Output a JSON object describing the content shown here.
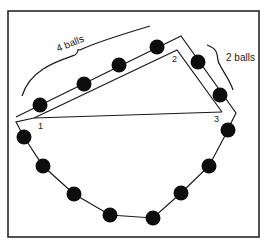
{
  "diagram": {
    "frame": {
      "x": 8,
      "y": 11,
      "width": 251,
      "height": 226
    },
    "colors": {
      "line": "#1a1a1a",
      "ball": "#0d0d0d",
      "background": "#ffffff"
    },
    "labels": {
      "four_balls": "4 balls",
      "two_balls": "2 balls",
      "vertex_1": "1",
      "vertex_2": "2",
      "vertex_3": "3"
    },
    "triangle": {
      "v1": [
        34,
        118
      ],
      "v2": [
        177,
        50
      ],
      "v3": [
        222,
        112
      ]
    },
    "balls": [
      [
        40,
        105
      ],
      [
        84,
        84
      ],
      [
        119,
        65
      ],
      [
        157,
        47
      ],
      [
        198,
        62
      ],
      [
        220,
        95
      ],
      [
        228,
        130
      ],
      [
        209,
        166
      ],
      [
        181,
        193
      ],
      [
        153,
        218
      ],
      [
        110,
        215
      ],
      [
        74,
        194
      ],
      [
        43,
        166
      ],
      [
        24,
        137
      ]
    ]
  }
}
